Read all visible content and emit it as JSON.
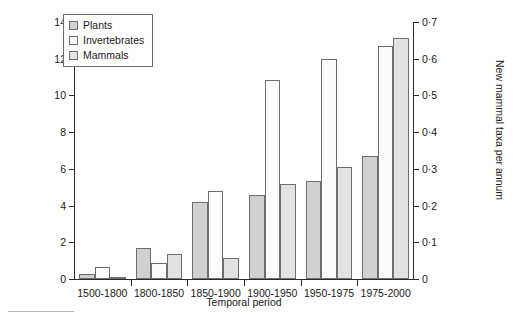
{
  "chart_data": {
    "type": "bar",
    "title": "",
    "xlabel": "Temporal period",
    "ylabel": "New plant & invertebrate taxa per annum",
    "ylabel_right": "New mammal taxa per annum",
    "categories": [
      "1500-1800",
      "1800-1850",
      "1850-1900",
      "1900-1950",
      "1950-1975",
      "1975-2000"
    ],
    "series": [
      {
        "name": "Plants",
        "values": [
          0.3,
          1.7,
          4.2,
          4.6,
          5.35,
          6.7
        ],
        "axis": "left",
        "color": "#d0d0d0"
      },
      {
        "name": "Invertebrates",
        "values": [
          0.65,
          0.85,
          4.8,
          10.85,
          12.0,
          12.7
        ],
        "axis": "left",
        "color": "#fbfbfb"
      },
      {
        "name": "Mammals",
        "values": [
          0.05,
          1.35,
          1.15,
          5.2,
          6.1,
          13.15
        ],
        "axis": "left",
        "color": "#e2e2e2"
      }
    ],
    "ylim": [
      0,
      14
    ],
    "yticks": [
      "0",
      "2",
      "4",
      "6",
      "8",
      "10",
      "12",
      "14"
    ],
    "ylim_right": [
      0,
      0.7
    ],
    "yticks_right": [
      "0",
      "0·1",
      "0·2",
      "0·3",
      "0·4",
      "0·5",
      "0·6",
      "0·7"
    ],
    "grid": false,
    "legend_position": "top-left"
  },
  "legend": {
    "items": [
      {
        "label": "Plants",
        "color": "#d0d0d0"
      },
      {
        "label": "Invertebrates",
        "color": "#fbfbfb"
      },
      {
        "label": "Mammals",
        "color": "#e2e2e2"
      }
    ]
  }
}
